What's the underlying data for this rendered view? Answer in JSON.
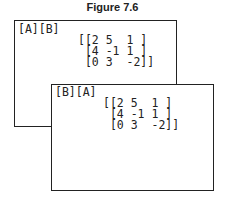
{
  "figure": {
    "title": "Figure 7.6"
  },
  "screens": [
    {
      "command": "[A][B]",
      "rows": [
        "[[2 5  1 ]",
        " [4 -1 1 ]",
        " [0 3  -2]]"
      ]
    },
    {
      "command": "[B][A]",
      "rows": [
        "[[2 5  1 ]",
        " [4 -1 1 ]",
        " [0 3  -2]]"
      ]
    }
  ]
}
